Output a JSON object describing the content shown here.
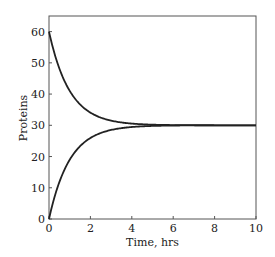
{
  "chart_data": {
    "type": "line",
    "title": "",
    "xlabel": "Time, hrs",
    "ylabel": "Proteins",
    "xlim": [
      0,
      10
    ],
    "ylim": [
      0,
      65
    ],
    "xticks": [
      0,
      2,
      4,
      6,
      8,
      10
    ],
    "yticks": [
      0,
      10,
      20,
      30,
      40,
      50,
      60
    ],
    "grid": false,
    "legend": null,
    "series": [
      {
        "name": "decay from 60",
        "formula": "30 + 30*exp(-t)",
        "x": [
          0,
          0.5,
          1,
          1.5,
          2,
          2.5,
          3,
          4,
          5,
          6,
          7,
          8,
          9,
          10
        ],
        "values": [
          60,
          48.2,
          41.0,
          36.7,
          34.1,
          32.5,
          31.5,
          30.5,
          30.2,
          30.1,
          30.0,
          30.0,
          30.0,
          30.0
        ]
      },
      {
        "name": "rise from 0",
        "formula": "30 - 30*exp(-t)",
        "x": [
          0,
          0.5,
          1,
          1.5,
          2,
          2.5,
          3,
          4,
          5,
          6,
          7,
          8,
          9,
          10
        ],
        "values": [
          0,
          11.8,
          19.0,
          23.3,
          25.9,
          27.5,
          28.5,
          29.5,
          29.8,
          29.9,
          30.0,
          30.0,
          30.0,
          30.0
        ]
      }
    ],
    "line_color": "#222222"
  }
}
